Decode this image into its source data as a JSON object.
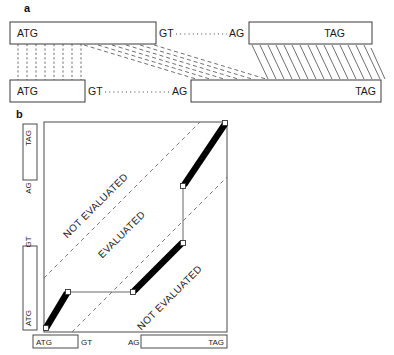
{
  "figure": {
    "panel_a": {
      "letter": "a",
      "top_model": {
        "exon1_start_codon": "ATG",
        "donor": "GT",
        "acceptor": "AG",
        "exon2_stop_codon": "TAG"
      },
      "bottom_model": {
        "exon1_start_codon": "ATG",
        "donor": "GT",
        "acceptor": "AG",
        "exon2_stop_codon": "TAG"
      }
    },
    "panel_b": {
      "letter": "b",
      "y_axis": {
        "label_top": "TAG",
        "label_acceptor": "AG",
        "label_donor": "GT",
        "label_bottom": "ATG"
      },
      "x_axis": {
        "label_start": "ATG",
        "label_donor": "GT",
        "label_acceptor": "AG",
        "label_stop": "TAG"
      },
      "regions": [
        {
          "name": "upper-not-evaluated",
          "label": "NOT EVALUATED"
        },
        {
          "name": "evaluated-band",
          "label": "EVALUATED"
        },
        {
          "name": "lower-not-evaluated",
          "label": "NOT EVALUATED"
        }
      ]
    }
  },
  "colors": {
    "ink": "#1a1a1a",
    "box_stroke": "#3a3a3a",
    "alignment_fill": "#000000",
    "dashed_guide": "#555555",
    "marker_fill": "#ffffff",
    "background": "#ffffff"
  }
}
